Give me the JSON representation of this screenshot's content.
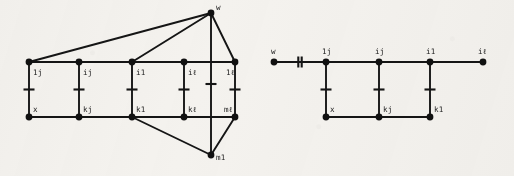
{
  "figure": {
    "background_color": "#f4f2ee",
    "ink_color": "#151515",
    "width": 514,
    "height": 176,
    "caption": "",
    "panels": [
      {
        "id": "left-graph",
        "name": "left-graph-panel",
        "description": "grid graph with apex vertices w and m1",
        "nodes": [
          {
            "id": "L-t1",
            "label": "1j",
            "x": 29,
            "y": 62,
            "label_dx": 4,
            "label_dy": 13
          },
          {
            "id": "L-t2",
            "label": "ij",
            "x": 79,
            "y": 62,
            "label_dx": 4,
            "label_dy": 13
          },
          {
            "id": "L-t3",
            "label": "i1",
            "x": 132,
            "y": 62,
            "label_dx": 4,
            "label_dy": 13
          },
          {
            "id": "L-t4",
            "label": "iℓ",
            "x": 184,
            "y": 62,
            "label_dx": 4,
            "label_dy": 13
          },
          {
            "id": "L-t5",
            "label": "1ℓ",
            "x": 235,
            "y": 62,
            "label_dx": -9,
            "label_dy": 13
          },
          {
            "id": "L-b1",
            "label": "x",
            "x": 29,
            "y": 117,
            "label_dx": 4,
            "label_dy": -5
          },
          {
            "id": "L-b2",
            "label": "kj",
            "x": 79,
            "y": 117,
            "label_dx": 4,
            "label_dy": -5
          },
          {
            "id": "L-b3",
            "label": "k1",
            "x": 132,
            "y": 117,
            "label_dx": 4,
            "label_dy": -5
          },
          {
            "id": "L-b4",
            "label": "kℓ",
            "x": 184,
            "y": 117,
            "label_dx": 4,
            "label_dy": -5
          },
          {
            "id": "L-b5",
            "label": "mℓ",
            "x": 235,
            "y": 117,
            "label_dx": -11,
            "label_dy": -5
          },
          {
            "id": "L-w",
            "label": "w",
            "x": 211,
            "y": 13,
            "label_dx": 5,
            "label_dy": -3
          },
          {
            "id": "L-m1",
            "label": "m1",
            "x": 211,
            "y": 155,
            "label_dx": 5,
            "label_dy": 5
          }
        ],
        "edges": [
          {
            "from": "L-t1",
            "to": "L-t2",
            "tick": 0
          },
          {
            "from": "L-t2",
            "to": "L-t3",
            "tick": 0
          },
          {
            "from": "L-t3",
            "to": "L-t4",
            "tick": 0
          },
          {
            "from": "L-t4",
            "to": "L-t5",
            "tick": 0
          },
          {
            "from": "L-b1",
            "to": "L-b2",
            "tick": 0
          },
          {
            "from": "L-b2",
            "to": "L-b3",
            "tick": 0
          },
          {
            "from": "L-b3",
            "to": "L-b4",
            "tick": 0
          },
          {
            "from": "L-b4",
            "to": "L-b5",
            "tick": 0
          },
          {
            "from": "L-t1",
            "to": "L-b1",
            "tick": 1
          },
          {
            "from": "L-t2",
            "to": "L-b2",
            "tick": 1
          },
          {
            "from": "L-t3",
            "to": "L-b3",
            "tick": 1
          },
          {
            "from": "L-t4",
            "to": "L-b4",
            "tick": 1
          },
          {
            "from": "L-t5",
            "to": "L-b5",
            "tick": 1
          },
          {
            "from": "L-w",
            "to": "L-m1",
            "tick": 1
          },
          {
            "from": "L-w",
            "to": "L-t1",
            "tick": 0
          },
          {
            "from": "L-w",
            "to": "L-t3",
            "tick": 0
          },
          {
            "from": "L-w",
            "to": "L-t5",
            "tick": 0
          },
          {
            "from": "L-m1",
            "to": "L-b3",
            "tick": 0
          },
          {
            "from": "L-m1",
            "to": "L-b5",
            "tick": 0
          }
        ]
      },
      {
        "id": "right-graph",
        "name": "right-graph-panel",
        "description": "path graph with pendant vertex w joined by a double-tick edge",
        "nodes": [
          {
            "id": "R-w",
            "label": "w",
            "x": 274,
            "y": 62,
            "label_dx": -3,
            "label_dy": -8
          },
          {
            "id": "R-t1",
            "label": "1j",
            "x": 326,
            "y": 62,
            "label_dx": -4,
            "label_dy": -8
          },
          {
            "id": "R-t2",
            "label": "ij",
            "x": 379,
            "y": 62,
            "label_dx": -4,
            "label_dy": -8
          },
          {
            "id": "R-t3",
            "label": "i1",
            "x": 430,
            "y": 62,
            "label_dx": -4,
            "label_dy": -8
          },
          {
            "id": "R-t4",
            "label": "iℓ",
            "x": 483,
            "y": 62,
            "label_dx": -5,
            "label_dy": -8
          },
          {
            "id": "R-b1",
            "label": "x",
            "x": 326,
            "y": 117,
            "label_dx": 4,
            "label_dy": -5
          },
          {
            "id": "R-b2",
            "label": "kj",
            "x": 379,
            "y": 117,
            "label_dx": 4,
            "label_dy": -5
          },
          {
            "id": "R-b3",
            "label": "k1",
            "x": 430,
            "y": 117,
            "label_dx": 4,
            "label_dy": -5
          }
        ],
        "edges": [
          {
            "from": "R-w",
            "to": "R-t1",
            "tick": 2
          },
          {
            "from": "R-t1",
            "to": "R-t2",
            "tick": 0
          },
          {
            "from": "R-t2",
            "to": "R-t3",
            "tick": 0
          },
          {
            "from": "R-t3",
            "to": "R-t4",
            "tick": 0
          },
          {
            "from": "R-t1",
            "to": "R-b1",
            "tick": 1
          },
          {
            "from": "R-t2",
            "to": "R-b2",
            "tick": 1
          },
          {
            "from": "R-t3",
            "to": "R-b3",
            "tick": 1
          },
          {
            "from": "R-b1",
            "to": "R-b2",
            "tick": 0
          },
          {
            "from": "R-b2",
            "to": "R-b3",
            "tick": 0
          }
        ]
      }
    ],
    "node_radius": 3.4,
    "tick_half_length": 5.5,
    "double_tick_gap": 3.4
  }
}
